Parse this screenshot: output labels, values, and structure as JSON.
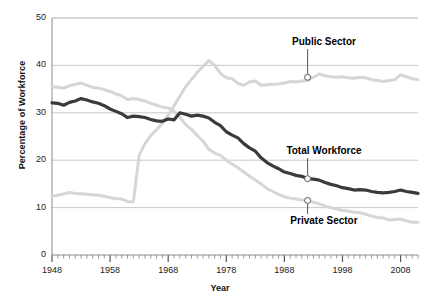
{
  "chart_data": {
    "type": "line",
    "title": "",
    "xlabel": "Year",
    "ylabel": "Percentage of Workforce",
    "xlim": [
      1948,
      2011
    ],
    "ylim": [
      0,
      50
    ],
    "yticks": [
      0,
      10,
      20,
      30,
      40,
      50
    ],
    "xticks": [
      1948,
      1958,
      1968,
      1978,
      1988,
      1998,
      2008
    ],
    "grid": "horizontal",
    "legend_position": "inline-annotations",
    "annotations": [
      {
        "text": "Public Sector",
        "series": "Public Sector",
        "year": 1992,
        "value": 37.5
      },
      {
        "text": "Total Workforce",
        "series": "Total Workforce",
        "year": 1992,
        "value": 16.1
      },
      {
        "text": "Private Sector",
        "series": "Private Sector",
        "year": 1992,
        "value": 11.5
      }
    ],
    "x": [
      1948,
      1949,
      1950,
      1951,
      1952,
      1953,
      1954,
      1955,
      1956,
      1957,
      1958,
      1959,
      1960,
      1961,
      1962,
      1963,
      1964,
      1965,
      1966,
      1967,
      1968,
      1969,
      1970,
      1971,
      1972,
      1973,
      1974,
      1975,
      1976,
      1977,
      1978,
      1979,
      1980,
      1981,
      1982,
      1983,
      1984,
      1985,
      1986,
      1987,
      1988,
      1989,
      1990,
      1991,
      1992,
      1993,
      1994,
      1995,
      1996,
      1997,
      1998,
      1999,
      2000,
      2001,
      2002,
      2003,
      2004,
      2005,
      2006,
      2007,
      2008,
      2009,
      2010,
      2011
    ],
    "series": [
      {
        "name": "Total Workforce",
        "color": "#3b3b3b",
        "values": [
          32.1,
          32.0,
          31.6,
          32.2,
          32.5,
          33.0,
          32.7,
          32.3,
          32.0,
          31.5,
          30.8,
          30.3,
          29.8,
          29.0,
          29.3,
          29.2,
          29.0,
          28.6,
          28.3,
          28.2,
          28.7,
          28.5,
          30.0,
          29.7,
          29.3,
          29.5,
          29.3,
          28.9,
          28.0,
          27.3,
          26.0,
          25.3,
          24.7,
          23.5,
          22.6,
          21.9,
          20.5,
          19.5,
          18.8,
          18.2,
          17.5,
          17.2,
          16.8,
          16.6,
          16.1,
          16.0,
          15.8,
          15.3,
          14.9,
          14.6,
          14.2,
          14.0,
          13.7,
          13.8,
          13.7,
          13.4,
          13.2,
          13.1,
          13.2,
          13.4,
          13.7,
          13.4,
          13.2,
          13.0
        ]
      },
      {
        "name": "Public Sector",
        "color": "#d6d6d6",
        "values": [
          12.4,
          12.6,
          12.9,
          13.2,
          13.0,
          12.9,
          12.8,
          12.7,
          12.6,
          12.4,
          12.1,
          11.9,
          11.8,
          11.3,
          11.2,
          21.0,
          23.5,
          25.2,
          26.4,
          27.8,
          29.5,
          31.5,
          33.5,
          35.5,
          37.0,
          38.5,
          39.8,
          41.0,
          40.0,
          38.3,
          37.4,
          37.2,
          36.2,
          35.8,
          36.5,
          36.7,
          35.8,
          35.9,
          36.0,
          36.1,
          36.3,
          36.6,
          36.5,
          36.7,
          36.8,
          37.5,
          38.2,
          37.8,
          37.6,
          37.5,
          37.6,
          37.4,
          37.3,
          37.5,
          37.4,
          37.0,
          36.8,
          36.6,
          36.8,
          37.0,
          38.0,
          37.6,
          37.2,
          37.0
        ]
      },
      {
        "name": "Private Sector",
        "color": "#d6d6d6",
        "values": [
          35.5,
          35.4,
          35.2,
          35.7,
          36.0,
          36.3,
          35.8,
          35.4,
          35.2,
          34.9,
          34.5,
          34.0,
          33.6,
          32.8,
          33.0,
          32.8,
          32.5,
          32.0,
          31.6,
          31.2,
          31.0,
          30.3,
          29.1,
          27.5,
          26.5,
          25.2,
          24.0,
          22.3,
          21.5,
          21.0,
          20.0,
          19.2,
          18.4,
          17.5,
          16.6,
          15.8,
          15.0,
          14.0,
          13.4,
          12.8,
          12.3,
          12.0,
          11.8,
          11.6,
          11.5,
          11.1,
          10.8,
          10.3,
          10.0,
          9.7,
          9.4,
          9.3,
          9.0,
          8.9,
          8.6,
          8.2,
          7.9,
          7.8,
          7.4,
          7.5,
          7.6,
          7.2,
          6.9,
          6.9
        ]
      }
    ]
  },
  "axis": {
    "ytick_labels": [
      "50",
      "40",
      "30",
      "20",
      "10",
      "0"
    ],
    "xtick_labels": [
      "1948",
      "1958",
      "1968",
      "1978",
      "1988",
      "1998",
      "2008"
    ],
    "x_title": "Year",
    "y_title": "Percentage of Workforce"
  },
  "labels": {
    "public_sector": "Public Sector",
    "total_workforce": "Total Workforce",
    "private_sector": "Private Sector"
  },
  "colors": {
    "dark_line": "#3b3b3b",
    "light_line": "#d6d6d6",
    "grid": "#c9c9c9",
    "axis": "#8a8a8a",
    "text": "#111111"
  }
}
